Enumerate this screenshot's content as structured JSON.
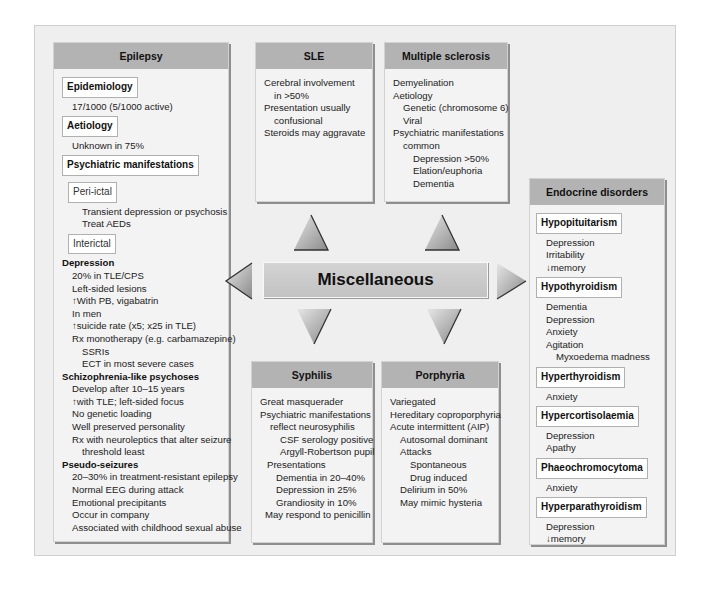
{
  "center": {
    "title": "Miscellaneous"
  },
  "arrows": {
    "up": [
      "up-arrow-sle",
      "up-arrow-ms"
    ],
    "down": [
      "down-arrow-syphilis",
      "down-arrow-porphyria"
    ],
    "left": "left-arrow-epilepsy",
    "right": "right-arrow-endocrine"
  },
  "epilepsy": {
    "title": "Epilepsy",
    "epidemiology": {
      "tag": "Epidemiology",
      "lines": [
        "17/1000 (5/1000 active)"
      ]
    },
    "aetiology": {
      "tag": "Aetiology",
      "lines": [
        "Unknown in 75%"
      ]
    },
    "psychiatric": {
      "tag": "Psychiatric manifestations"
    },
    "periictal": {
      "tag": "Peri-ictal",
      "lines": [
        "Transient depression or psychosis",
        "Treat  AEDs"
      ]
    },
    "interictal": {
      "tag": "Interictal"
    },
    "depression": {
      "heading": "Depression",
      "lines": [
        "20% in TLE/CPS",
        "Left-sided lesions",
        "↑With PB, vigabatrin",
        "In men",
        "↑suicide rate (x5; x25 in TLE)",
        "Rx monotherapy (e.g. carbamazepine)"
      ],
      "sub": [
        "SSRIs",
        "ECT in most severe cases"
      ]
    },
    "schizo": {
      "heading": "Schizophrenia-like psychoses",
      "lines": [
        "Develop after 10–15 years",
        "↑with TLE; left-sided focus",
        "No genetic loading",
        "Well preserved personality",
        "Rx with neuroleptics that alter seizure"
      ],
      "cont": "threshold least"
    },
    "pseudo": {
      "heading": "Pseudo-seizures",
      "lines": [
        "20–30% in treatment-resistant epilepsy",
        "Normal EEG during attack",
        "Emotional precipitants",
        "Occur in company",
        "Associated with childhood sexual abuse"
      ]
    }
  },
  "sle": {
    "title": "SLE",
    "lines": [
      "Cerebral involvement",
      "in >50%",
      "Presentation usually",
      "confusional",
      "Steroids may aggravate"
    ]
  },
  "ms": {
    "title": "Multiple sclerosis",
    "lines": [
      "Demyelination",
      "Aetiology",
      "Genetic (chromosome 6)",
      "Viral",
      "Psychiatric manifestations",
      "common",
      "Depression >50%",
      "Elation/euphoria",
      "Dementia"
    ]
  },
  "syphilis": {
    "title": "Syphilis",
    "lines": [
      "Great masquerader",
      "Psychiatric manifestations",
      "reflect neurosyphilis",
      "CSF serology positive",
      "Argyll-Robertson pupil",
      "Presentations",
      "Dementia in 20–40%",
      "Depression in 25%",
      "Grandiosity in 10%",
      "May respond to penicillin"
    ]
  },
  "porphyria": {
    "title": "Porphyria",
    "lines": [
      "Variegated",
      "Hereditary coproporphyria",
      "Acute intermittent (AIP)",
      "Autosomal dominant",
      "Attacks",
      "Spontaneous",
      "Drug induced",
      "Delirium in 50%",
      "May mimic hysteria"
    ]
  },
  "endocrine": {
    "title": "Endocrine disorders",
    "sections": [
      {
        "tag": "Hypopituitarism",
        "lines": [
          "Depression",
          "Irritability",
          "↓memory"
        ]
      },
      {
        "tag": "Hypothyroidism",
        "lines": [
          "Dementia",
          "Depression",
          "Anxiety",
          "Agitation"
        ],
        "sub": "Myxoedema madness"
      },
      {
        "tag": "Hyperthyroidism",
        "lines": [
          "Anxiety"
        ]
      },
      {
        "tag": "Hypercortisolaemia",
        "lines": [
          "Depression",
          "Apathy"
        ]
      },
      {
        "tag": "Phaeochromocytoma",
        "lines": [
          "Anxiety"
        ]
      },
      {
        "tag": "Hyperparathyroidism",
        "lines": [
          "Depression",
          "↓memory"
        ]
      }
    ]
  },
  "colors": {
    "frame_bg": "#efefef",
    "header_bg": "#b3b3b3",
    "box_bg": "#f3f3f3",
    "tag_bg": "#ffffff"
  }
}
